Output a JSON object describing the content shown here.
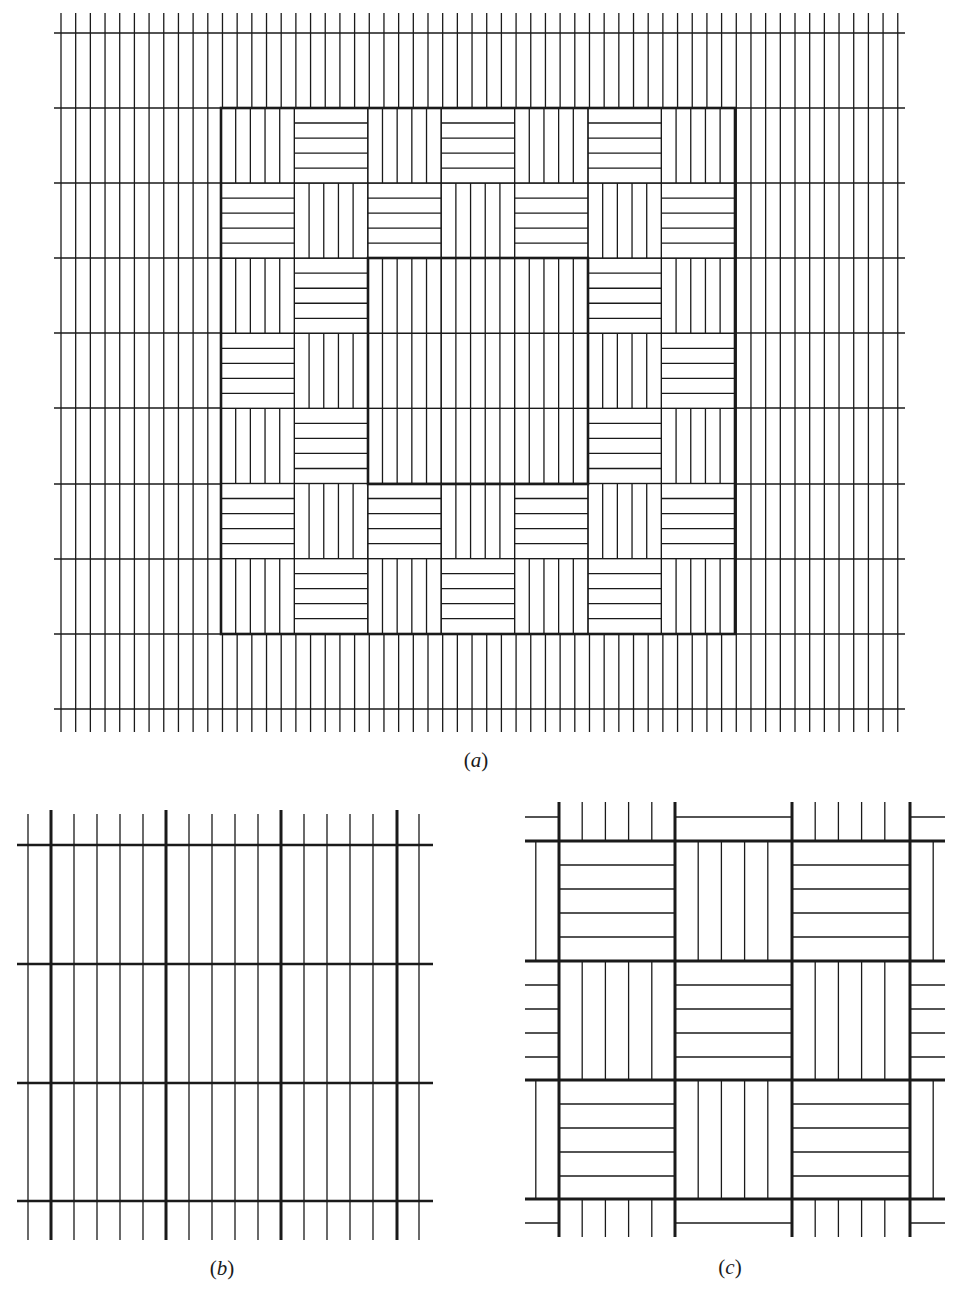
{
  "figure": {
    "ink_color": "#1a1a1a",
    "background": "#ffffff",
    "panels": [
      {
        "id": "a",
        "caption": {
          "open": "(",
          "letter": "a",
          "close": ")",
          "x": 476,
          "y": 748
        },
        "description": "Large field of parallel vertical strips with horizontal cross-lines; a 7x7 checkerboard of alternating vertical/horizontal strip cells framed by a thick outer square, with a plain 3x3 central square of vertical strips framed by a thick inner square",
        "background_grid": {
          "x0": 61,
          "strip": 14.68,
          "vertical_count": 58,
          "v_top": 13,
          "v_bottom": 732,
          "h_lines_y": [
            33,
            108,
            183,
            258,
            333,
            408,
            484,
            559,
            634,
            709
          ],
          "h_left": 54,
          "h_right": 905
        },
        "checker": {
          "x0": 221,
          "y0": 108,
          "cols": 7,
          "rows": 7,
          "cell_w": 73.4,
          "cell_h": 75.1,
          "strips_per_cell": 5,
          "even_orientation": "vertical",
          "plain_center": {
            "col0": 2,
            "row0": 2,
            "cols": 3,
            "rows": 3
          }
        },
        "outer_frame": {
          "x": 221,
          "y": 108,
          "w": 514,
          "h": 526
        },
        "inner_frame": {
          "x": 368,
          "y": 258,
          "w": 220,
          "h": 226
        }
      },
      {
        "id": "b",
        "caption": {
          "open": "(",
          "letter": "b",
          "close": ")",
          "x": 222,
          "y": 1256
        },
        "description": "Grid of vertical strips (thin lines) with thick vertical lines every 5 strips and thick horizontal cross-lines",
        "thin_x0": 28,
        "strip": 23.0,
        "thin_count": 18,
        "thick_x": [
          51,
          166,
          281,
          397
        ],
        "v_top": 810,
        "v_bottom": 1240,
        "h_lines_y": [
          845,
          964,
          1083,
          1201
        ],
        "h_left": 17,
        "h_right": 433
      },
      {
        "id": "c",
        "caption": {
          "open": "(",
          "letter": "c",
          "close": ")",
          "x": 730,
          "y": 1255
        },
        "description": "Basket-weave checkerboard: 3x3 thick-framed cells alternating horizontal and vertical strips, with partial cells continuing the pattern at each edge",
        "thick_x": [
          559,
          675,
          792,
          910
        ],
        "thick_y": [
          841,
          961,
          1080,
          1199
        ],
        "left_edge": 525,
        "right_edge": 945,
        "top_edge": 802,
        "bottom_edge": 1237,
        "strips_per_cell": 5,
        "origin_orientation": "horizontal"
      }
    ]
  }
}
